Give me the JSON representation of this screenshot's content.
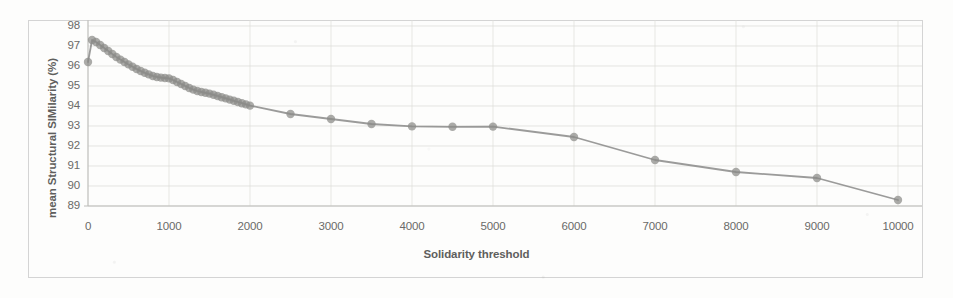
{
  "chart_data": {
    "type": "line",
    "title": "",
    "xlabel": "Solidarity threshold",
    "ylabel": "mean Structural SIMilarity (%)",
    "xlim": [
      0,
      10000
    ],
    "ylim": [
      89,
      98
    ],
    "xticks": [
      "0",
      "1000",
      "2000",
      "3000",
      "4000",
      "5000",
      "6000",
      "7000",
      "8000",
      "9000",
      "10000"
    ],
    "yticks": [
      "98",
      "97",
      "96",
      "95",
      "94",
      "93",
      "92",
      "91",
      "90",
      "89"
    ],
    "grid": true,
    "legend": "none",
    "marker": "circle",
    "series_color": "#8a8a88",
    "series": [
      {
        "name": "mean SSIM",
        "x": [
          0,
          50,
          100,
          150,
          200,
          250,
          300,
          350,
          400,
          450,
          500,
          550,
          600,
          650,
          700,
          750,
          800,
          850,
          900,
          950,
          1000,
          1050,
          1100,
          1150,
          1200,
          1250,
          1300,
          1350,
          1400,
          1450,
          1500,
          1550,
          1600,
          1650,
          1700,
          1750,
          1800,
          1850,
          1900,
          1950,
          2000,
          2500,
          3000,
          3500,
          4000,
          4500,
          5000,
          6000,
          7000,
          8000,
          9000,
          10000
        ],
        "values": [
          96.2,
          97.3,
          97.2,
          97.05,
          96.9,
          96.75,
          96.6,
          96.45,
          96.32,
          96.2,
          96.08,
          95.96,
          95.85,
          95.75,
          95.66,
          95.58,
          95.5,
          95.45,
          95.42,
          95.4,
          95.38,
          95.3,
          95.2,
          95.1,
          95.0,
          94.9,
          94.82,
          94.75,
          94.7,
          94.66,
          94.62,
          94.56,
          94.5,
          94.44,
          94.38,
          94.32,
          94.26,
          94.2,
          94.14,
          94.08,
          94.02,
          93.6,
          93.35,
          93.1,
          92.98,
          92.96,
          92.97,
          92.45,
          91.3,
          90.7,
          90.4,
          89.3
        ]
      }
    ]
  }
}
